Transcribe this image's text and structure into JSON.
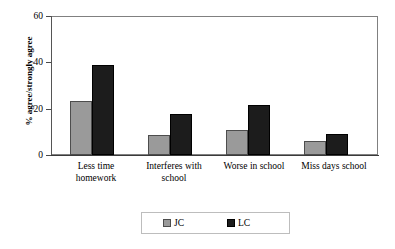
{
  "chart_data": {
    "type": "bar",
    "title": "",
    "xlabel": "",
    "ylabel": "% agree/strongly agree",
    "ylim": [
      0,
      60
    ],
    "yticks": [
      0,
      20,
      40,
      60
    ],
    "ytick_labels": [
      "0",
      "20",
      "40",
      "60"
    ],
    "grid": false,
    "legend_position": "bottom",
    "categories": [
      "Less time homework",
      "Interferes with school",
      "Worse in school",
      "Miss days school"
    ],
    "category_lines": [
      [
        "Less time",
        "homework"
      ],
      [
        "Interferes with",
        "school"
      ],
      [
        "Worse in school"
      ],
      [
        "Miss days school"
      ]
    ],
    "series": [
      {
        "name": "JC",
        "color": "#9a9a9a",
        "values": [
          23.5,
          8.5,
          11,
          6
        ]
      },
      {
        "name": "LC",
        "color": "#1c1c1c",
        "values": [
          39,
          17.5,
          21.5,
          9
        ]
      }
    ]
  },
  "legend": {
    "items": [
      {
        "label": "JC"
      },
      {
        "label": "LC"
      }
    ]
  }
}
